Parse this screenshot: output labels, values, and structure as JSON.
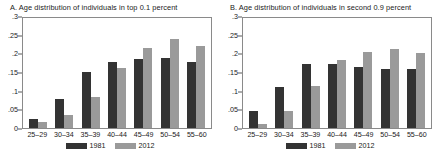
{
  "figure": {
    "panels": [
      {
        "title": "A. Age distribution of individuals in top 0.1 percent",
        "chart_ref": 0
      },
      {
        "title": "B. Age distribution of individuals in second 0.9 percent",
        "chart_ref": 1
      }
    ],
    "legend": [
      {
        "label": "1981",
        "color": "#333333"
      },
      {
        "label": "2012",
        "color": "#9a9a9a"
      }
    ]
  },
  "chart_data": [
    {
      "type": "bar",
      "title": "A. Age distribution of individuals in top 0.1 percent",
      "xlabel": "",
      "ylabel": "",
      "categories": [
        "25–29",
        "30–34",
        "35–39",
        "40–44",
        "45–49",
        "50–54",
        "55–60"
      ],
      "series": [
        {
          "name": "1981",
          "color": "#333333",
          "values": [
            0.023,
            0.079,
            0.151,
            0.178,
            0.185,
            0.187,
            0.178
          ]
        },
        {
          "name": "2012",
          "color": "#9a9a9a",
          "values": [
            0.017,
            0.036,
            0.082,
            0.161,
            0.215,
            0.239,
            0.221
          ]
        }
      ],
      "ylim": [
        0,
        0.3
      ],
      "yticks": [
        0,
        0.05,
        0.1,
        0.15,
        0.2,
        0.25,
        0.3
      ],
      "ytick_labels": [
        "0",
        ".05",
        ".1",
        ".15",
        ".2",
        ".25",
        ".3"
      ],
      "grid": false,
      "legend_position": "bottom"
    },
    {
      "type": "bar",
      "title": "B. Age distribution of individuals in second 0.9 percent",
      "xlabel": "",
      "ylabel": "",
      "categories": [
        "25–29",
        "30–34",
        "35–39",
        "40–44",
        "45–49",
        "50–54",
        "55–60"
      ],
      "series": [
        {
          "name": "1981",
          "color": "#333333",
          "values": [
            0.046,
            0.111,
            0.171,
            0.172,
            0.163,
            0.159,
            0.157
          ]
        },
        {
          "name": "2012",
          "color": "#9a9a9a",
          "values": [
            0.011,
            0.046,
            0.112,
            0.182,
            0.204,
            0.211,
            0.201
          ]
        }
      ],
      "ylim": [
        0,
        0.3
      ],
      "yticks": [
        0,
        0.05,
        0.1,
        0.15,
        0.2,
        0.25,
        0.3
      ],
      "ytick_labels": [
        "0",
        ".05",
        ".1",
        ".15",
        ".2",
        ".25",
        ".3"
      ],
      "grid": false,
      "legend_position": "bottom"
    }
  ]
}
